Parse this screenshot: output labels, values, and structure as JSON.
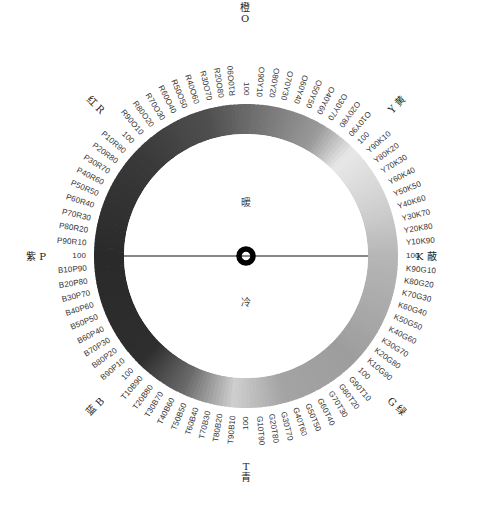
{
  "wheel": {
    "center": [
      246,
      256
    ],
    "outer_radius": 152,
    "inner_radius": 122,
    "label_radius": 160,
    "ring_gradient": [
      {
        "angle": 0,
        "color": "#6a6a6a"
      },
      {
        "angle": 30,
        "color": "#9a9a9a"
      },
      {
        "angle": 45,
        "color": "#e8e8e8"
      },
      {
        "angle": 70,
        "color": "#cfcfcf"
      },
      {
        "angle": 90,
        "color": "#b6b6b6"
      },
      {
        "angle": 135,
        "color": "#9d9d9d"
      },
      {
        "angle": 165,
        "color": "#a4a4a4"
      },
      {
        "angle": 185,
        "color": "#cfcfcf"
      },
      {
        "angle": 205,
        "color": "#6a6a6a"
      },
      {
        "angle": 225,
        "color": "#2e2e2e"
      },
      {
        "angle": 270,
        "color": "#2a2a2a"
      },
      {
        "angle": 315,
        "color": "#3a3a3a"
      },
      {
        "angle": 345,
        "color": "#505050"
      },
      {
        "angle": 360,
        "color": "#6a6a6a"
      }
    ],
    "axis_line_color": "#888888",
    "center_marker_color": "#000000"
  },
  "center_labels": {
    "warm": "暖",
    "cool": "冷"
  },
  "hues": [
    {
      "angle": 0,
      "cn": "橙",
      "code": "O"
    },
    {
      "angle": 45,
      "cn": "黄",
      "code": "Y"
    },
    {
      "angle": 90,
      "cn": "蔽",
      "code": "K"
    },
    {
      "angle": 135,
      "cn": "绿",
      "code": "G"
    },
    {
      "angle": 180,
      "cn": "青",
      "code": "T"
    },
    {
      "angle": 225,
      "cn": "蓝",
      "code": "B"
    },
    {
      "angle": 270,
      "cn": "紫",
      "code": "P"
    },
    {
      "angle": 315,
      "cn": "红",
      "code": "R"
    }
  ],
  "scale_labels": [
    "100",
    "O90Y10",
    "O80Y20",
    "O70Y30",
    "O60Y40",
    "O50Y50",
    "O40Y60",
    "O30Y70",
    "O20Y80",
    "O10Y90",
    "100",
    "Y90K10",
    "Y80K20",
    "Y70K30",
    "Y60K40",
    "Y50K50",
    "Y40K60",
    "Y30K70",
    "Y20K80",
    "Y10K90",
    "100",
    "K90G10",
    "K80G20",
    "K70G30",
    "K60G40",
    "K50G50",
    "K40G60",
    "K30G70",
    "K20G80",
    "K10G90",
    "100",
    "G90T10",
    "G80T20",
    "G70T30",
    "G60T40",
    "G50T50",
    "G40T60",
    "G30T70",
    "G20T80",
    "G10T90",
    "100",
    "T90B10",
    "T80B20",
    "T70B30",
    "T60B40",
    "T50B50",
    "T40B60",
    "T30B70",
    "T20B80",
    "T10B90",
    "100",
    "B90P10",
    "B80P20",
    "B70P30",
    "B60P40",
    "B50P50",
    "B40P60",
    "B30P70",
    "B20P80",
    "B10P90",
    "100",
    "P90R10",
    "P80R20",
    "P70R30",
    "P60R40",
    "P50R50",
    "P40R60",
    "P30R70",
    "P20R80",
    "P10R90",
    "100",
    "R90O10",
    "R80O20",
    "R70O30",
    "R60O40",
    "R50O50",
    "R40O60",
    "R30O70",
    "R20O80",
    "R10O90"
  ]
}
